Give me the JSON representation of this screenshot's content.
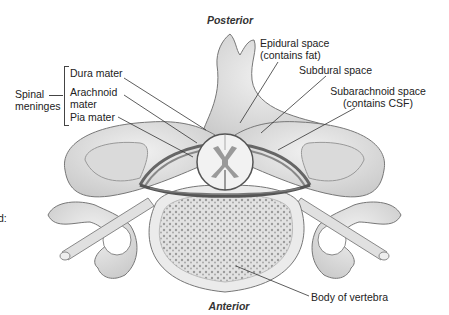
{
  "orientation": {
    "top": "Posterior",
    "bottom": "Anterior"
  },
  "group_label": {
    "line1": "Spinal",
    "line2": "meninges"
  },
  "meninges": [
    {
      "label_line1": "Dura mater",
      "label_line2": ""
    },
    {
      "label_line1": "Arachnoid",
      "label_line2": "mater"
    },
    {
      "label_line1": "Pia mater",
      "label_line2": ""
    }
  ],
  "spaces": [
    {
      "label_line1": "Epidural space",
      "label_line2": "(contains fat)"
    },
    {
      "label_line1": "Subdural space",
      "label_line2": ""
    },
    {
      "label_line1": "Subarachnoid space",
      "label_line2": "(contains CSF)"
    }
  ],
  "structures": {
    "body_of_vertebra": "Body of vertebra"
  },
  "cropped_edge_text": "d:",
  "colors": {
    "bone": "#e6e6e6",
    "bone_shadow": "#b9b9b9",
    "outline": "#6d6d6d",
    "leader_line": "#333333",
    "text": "#222222"
  }
}
